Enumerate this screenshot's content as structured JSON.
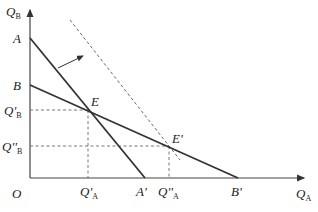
{
  "diagram": {
    "type": "economics-budget-line-shift",
    "axes": {
      "y_label": "Q",
      "y_sub": "B",
      "x_label": "Q",
      "x_sub": "A",
      "origin": "O"
    },
    "points": {
      "A": "A",
      "B": "B",
      "A_prime": "A'",
      "B_prime": "B'",
      "E": "E",
      "E_prime": "E'"
    },
    "ticks": {
      "QB_prime_main": "Q'",
      "QB_prime_sub": "B",
      "QB_dprime_main": "Q''",
      "QB_dprime_sub": "B",
      "QA_prime_main": "Q'",
      "QA_prime_sub": "A",
      "QA_dprime_main": "Q''",
      "QA_dprime_sub": "A"
    },
    "lines": [
      {
        "name": "line-AA'",
        "from": "A",
        "to": "A'",
        "style": "solid"
      },
      {
        "name": "line-BB'",
        "from": "B",
        "to": "B'",
        "style": "solid"
      },
      {
        "name": "shifted-line",
        "style": "dashed",
        "parallel_to": "AA'"
      }
    ],
    "colors": {
      "line": "#333333",
      "dashed": "#555555",
      "axis": "#444444"
    }
  }
}
